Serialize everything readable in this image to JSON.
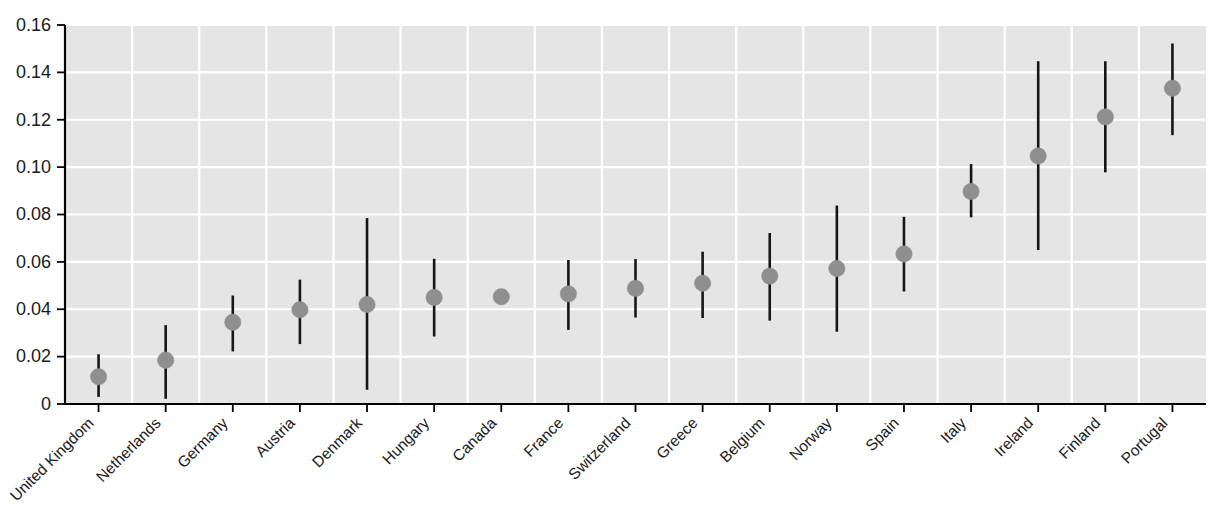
{
  "chart_data": {
    "type": "scatter",
    "title": "",
    "subtitle": "",
    "xlabel": "",
    "ylabel": "",
    "ylim": [
      0,
      0.16
    ],
    "yticks": [
      0,
      0.02,
      0.04,
      0.06,
      0.08,
      0.1,
      0.12,
      0.14,
      0.16
    ],
    "ytick_labels": [
      "0",
      "0.02",
      "0.04",
      "0.06",
      "0.08",
      "0.10",
      "0.12",
      "0.14",
      "0.16"
    ],
    "grid": true,
    "legend": "none",
    "categories": [
      "United Kingdom",
      "Netherlands",
      "Germany",
      "Austria",
      "Denmark",
      "Hungary",
      "Canada",
      "France",
      "Switzerland",
      "Greece",
      "Belgium",
      "Norway",
      "Spain",
      "Italy",
      "Ireland",
      "Finland",
      "Portugal"
    ],
    "values": [
      0.0115,
      0.0185,
      0.0345,
      0.0398,
      0.042,
      0.045,
      0.0453,
      0.0465,
      0.0488,
      0.051,
      0.054,
      0.0572,
      0.0633,
      0.0897,
      0.1047,
      0.1212,
      0.1333
    ],
    "ci_low": [
      0.003,
      0.0022,
      0.0222,
      0.0253,
      0.006,
      0.0285,
      0.0435,
      0.0313,
      0.0365,
      0.0363,
      0.0352,
      0.0305,
      0.0475,
      0.0788,
      0.065,
      0.0978,
      0.1135
    ],
    "ci_high": [
      0.021,
      0.0333,
      0.0458,
      0.0525,
      0.0785,
      0.0613,
      0.0472,
      0.0608,
      0.0612,
      0.0643,
      0.0722,
      0.0838,
      0.079,
      0.1013,
      0.1447,
      0.1447,
      0.1522
    ],
    "marker_color": "#8f8f8f",
    "errorbar_color": "#161616",
    "plot_bg_color": "#e5e5e5",
    "gridline_color": "#ffffff"
  },
  "caption": {
    "text": ""
  }
}
